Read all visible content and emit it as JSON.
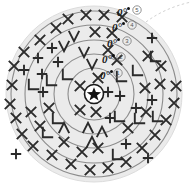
{
  "figure": {
    "type": "concentric-ring-target-diagram",
    "center_marker": "star",
    "disc": {
      "center_x": 94,
      "center_y": 94,
      "radius": 88,
      "fill": "#ebebeb",
      "edge": "#d8d8d8"
    },
    "dashed_arc": {
      "label": "dashed-guide-arc",
      "color": "#cfcfcf"
    },
    "rings": [
      {
        "id": 1,
        "number_label": "1",
        "angle_label": "0°",
        "radius": 26,
        "stroke": "#8c8c8c"
      },
      {
        "id": 2,
        "number_label": "2",
        "angle_label": "0°",
        "radius": 40,
        "stroke": "#8c8c8c"
      },
      {
        "id": 3,
        "number_label": "3",
        "angle_label": "0°",
        "radius": 54,
        "stroke": "#8c8c8c"
      },
      {
        "id": 4,
        "number_label": "4",
        "angle_label": "0°",
        "radius": 69,
        "stroke": "#8c8c8c"
      },
      {
        "id": 5,
        "number_label": "5",
        "angle_label": "0°",
        "radius": 83,
        "stroke": "#8c8c8c"
      }
    ],
    "marks": {
      "glyph_names": [
        "cross-mark",
        "plus-mark",
        "vee-mark",
        "corner-mark",
        "caret-mark"
      ],
      "items": [
        {
          "g": "x",
          "x": 104,
          "y": 15
        },
        {
          "g": "x",
          "x": 86,
          "y": 15
        },
        {
          "g": "x",
          "x": 68,
          "y": 19
        },
        {
          "g": "x",
          "x": 122,
          "y": 17
        },
        {
          "g": "x",
          "x": 56,
          "y": 28
        },
        {
          "g": "x",
          "x": 95,
          "y": 32
        },
        {
          "g": "x",
          "x": 112,
          "y": 33
        },
        {
          "g": "x",
          "x": 108,
          "y": 50
        },
        {
          "g": "x",
          "x": 98,
          "y": 78
        },
        {
          "g": "x",
          "x": 40,
          "y": 40
        },
        {
          "g": "x",
          "x": 24,
          "y": 52
        },
        {
          "g": "x",
          "x": 14,
          "y": 66
        },
        {
          "g": "x",
          "x": 12,
          "y": 85
        },
        {
          "g": "x",
          "x": 10,
          "y": 104
        },
        {
          "g": "x",
          "x": 16,
          "y": 118
        },
        {
          "g": "x",
          "x": 31,
          "y": 112
        },
        {
          "g": "x",
          "x": 49,
          "y": 108
        },
        {
          "g": "x",
          "x": 22,
          "y": 134
        },
        {
          "g": "x",
          "x": 33,
          "y": 146
        },
        {
          "g": "x",
          "x": 52,
          "y": 155
        },
        {
          "g": "x",
          "x": 71,
          "y": 164
        },
        {
          "g": "x",
          "x": 90,
          "y": 170
        },
        {
          "g": "x",
          "x": 108,
          "y": 168
        },
        {
          "g": "x",
          "x": 126,
          "y": 162
        },
        {
          "g": "x",
          "x": 82,
          "y": 152
        },
        {
          "g": "x",
          "x": 98,
          "y": 148
        },
        {
          "g": "x",
          "x": 64,
          "y": 142
        },
        {
          "g": "x",
          "x": 40,
          "y": 126
        },
        {
          "g": "x",
          "x": 142,
          "y": 148
        },
        {
          "g": "x",
          "x": 155,
          "y": 135
        },
        {
          "g": "x",
          "x": 166,
          "y": 120
        },
        {
          "g": "x",
          "x": 174,
          "y": 103
        },
        {
          "g": "x",
          "x": 176,
          "y": 86
        },
        {
          "g": "x",
          "x": 160,
          "y": 84
        },
        {
          "g": "x",
          "x": 145,
          "y": 88
        },
        {
          "g": "x",
          "x": 161,
          "y": 66
        },
        {
          "g": "x",
          "x": 148,
          "y": 56
        },
        {
          "g": "x",
          "x": 80,
          "y": 86
        },
        {
          "g": "x",
          "x": 80,
          "y": 110
        },
        {
          "g": "x",
          "x": 96,
          "y": 112
        },
        {
          "g": "x",
          "x": 128,
          "y": 128
        },
        {
          "g": "x",
          "x": 146,
          "y": 112
        },
        {
          "g": "x",
          "x": 117,
          "y": 60
        },
        {
          "g": "+",
          "x": 38,
          "y": 58
        },
        {
          "g": "+",
          "x": 52,
          "y": 48
        },
        {
          "g": "+",
          "x": 24,
          "y": 70
        },
        {
          "g": "+",
          "x": 42,
          "y": 74
        },
        {
          "g": "+",
          "x": 58,
          "y": 62
        },
        {
          "g": "+",
          "x": 152,
          "y": 38
        },
        {
          "g": "+",
          "x": 120,
          "y": 96
        },
        {
          "g": "+",
          "x": 136,
          "y": 108
        },
        {
          "g": "+",
          "x": 152,
          "y": 100
        },
        {
          "g": "+",
          "x": 110,
          "y": 118
        },
        {
          "g": "+",
          "x": 126,
          "y": 144
        },
        {
          "g": "+",
          "x": 148,
          "y": 158
        },
        {
          "g": "+",
          "x": 16,
          "y": 154
        },
        {
          "g": "+",
          "x": 43,
          "y": 92
        },
        {
          "g": "+",
          "x": 108,
          "y": 92
        },
        {
          "g": "v",
          "x": 74,
          "y": 36
        },
        {
          "g": "v",
          "x": 84,
          "y": 52
        },
        {
          "g": "v",
          "x": 92,
          "y": 64
        },
        {
          "g": "v",
          "x": 64,
          "y": 46
        },
        {
          "g": "corner",
          "x": 34,
          "y": 84
        },
        {
          "g": "corner",
          "x": 52,
          "y": 80
        },
        {
          "g": "corner",
          "x": 68,
          "y": 74
        },
        {
          "g": "corner",
          "x": 122,
          "y": 76
        },
        {
          "g": "corner",
          "x": 138,
          "y": 70
        },
        {
          "g": "corner",
          "x": 156,
          "y": 56
        },
        {
          "g": "corner",
          "x": 120,
          "y": 116
        },
        {
          "g": "corner",
          "x": 140,
          "y": 118
        },
        {
          "g": "corner",
          "x": 158,
          "y": 116
        },
        {
          "g": "corner",
          "x": 58,
          "y": 118
        },
        {
          "g": "corner",
          "x": 48,
          "y": 132
        },
        {
          "g": "corner",
          "x": 118,
          "y": 154
        },
        {
          "g": "caret",
          "x": 64,
          "y": 128
        },
        {
          "g": "caret",
          "x": 88,
          "y": 128
        },
        {
          "g": "caret",
          "x": 92,
          "y": 142
        },
        {
          "g": "caret",
          "x": 102,
          "y": 132
        }
      ]
    }
  }
}
